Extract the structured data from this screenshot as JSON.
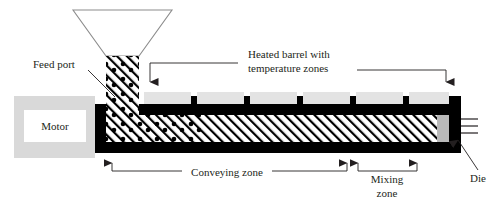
{
  "figure": {
    "background_color": "#ffffff",
    "line_color": "#231f20",
    "barrel_color": "#000000",
    "heater_block_color": "#e3e3e3",
    "motor_box_color": "#d9d9d9",
    "motor_inner_color": "#ffffff",
    "hopper_outline_color": "#8c8c8c",
    "width": 504,
    "height": 211
  },
  "labels": {
    "feed_port": "Feed port",
    "heated_barrel_line1": "Heated barrel with",
    "heated_barrel_line2": "temperature zones",
    "motor": "Motor",
    "conveying_zone": "Conveying zone",
    "mixing_zone_line1": "Mixing",
    "mixing_zone_line2": "zone",
    "die": "Die"
  },
  "components": {
    "hopper": {
      "name": "feed hopper",
      "top_left_x": 73,
      "top_right_x": 172,
      "top_y": 10,
      "bottom_left_x": 106,
      "bottom_right_x": 139,
      "bottom_y": 56
    },
    "feed_throat": {
      "name": "feed throat with pellets",
      "x": 106,
      "width": 33,
      "top_y": 56,
      "bottom_y": 140
    },
    "motor": {
      "name": "drive motor",
      "x": 14,
      "y": 96,
      "width": 81,
      "height": 62,
      "inner_x": 24,
      "inner_y": 110,
      "inner_width": 62,
      "inner_height": 32
    },
    "barrel": {
      "name": "heated barrel",
      "left_x": 95,
      "right_x": 461,
      "top_y": 96,
      "bottom_y": 152,
      "wall_thickness": 8
    },
    "screw": {
      "name": "hatched screw channel",
      "left_x": 103,
      "right_x": 452,
      "top_y": 110,
      "bottom_y": 142
    },
    "die_exit_lines": 3
  },
  "heater_blocks": {
    "count": 6,
    "color": "#e3e3e3",
    "y": 92,
    "height": 12,
    "blocks": [
      {
        "x": 144,
        "width": 47
      },
      {
        "x": 197,
        "width": 47
      },
      {
        "x": 250,
        "width": 47
      },
      {
        "x": 303,
        "width": 47
      },
      {
        "x": 356,
        "width": 47
      },
      {
        "x": 409,
        "width": 47
      }
    ]
  },
  "callouts": {
    "feed_port": {
      "text_x": 33,
      "text_y": 68,
      "leader_from_x": 88,
      "leader_from_y": 70,
      "leader_to_x": 114,
      "leader_to_y": 96
    },
    "heated_barrel": {
      "text_x": 248,
      "text_y": 60,
      "left_arrow_x": 150,
      "right_arrow_x": 446,
      "elbow_y": 70,
      "arrow_tip_y": 91
    },
    "conveying_zone": {
      "text_x": 180,
      "text_y": 175,
      "bracket_y": 170,
      "left_arrow_x": 112,
      "right_arrow_x": 347,
      "arrow_tip_y": 152
    },
    "mixing_zone": {
      "text_x": 366,
      "text_y1": 180,
      "text_y2": 194,
      "bracket_y": 170,
      "left_arrow_x": 358,
      "right_arrow_x": 417,
      "arrow_tip_y": 152
    },
    "die": {
      "text_x": 472,
      "text_y": 178,
      "leader_from_x": 470,
      "leader_from_y": 168,
      "leader_to_x": 452,
      "leader_to_y": 133
    }
  }
}
